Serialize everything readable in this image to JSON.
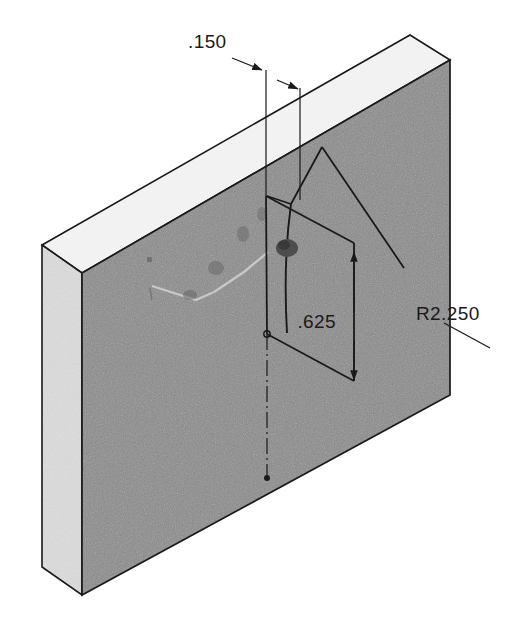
{
  "drawing": {
    "title": "Isometric plate with radiused slot detail",
    "view_type": "isometric",
    "background_color": "#ffffff"
  },
  "solid": {
    "name": "rectangular-plate",
    "faces": {
      "front": {
        "label": "front-face",
        "color": "#8a8a8a"
      },
      "top": {
        "label": "top-face",
        "color": "#f4f4f4"
      },
      "left": {
        "label": "left-side-face",
        "color": "#dcdcdc"
      }
    },
    "edge_color": "#1a1a1a"
  },
  "dimensions": [
    {
      "id": "width-dim",
      "value": ".150",
      "name": "dimension-150",
      "orientation": "leader-with-arrows",
      "text_x": 188,
      "text_y": 48
    },
    {
      "id": "height-dim",
      "value": ".625",
      "name": "dimension-625",
      "orientation": "vertical",
      "text_x": 336,
      "text_y": 328
    },
    {
      "id": "radius-dim",
      "value": "R2.250",
      "name": "dimension-r2250",
      "orientation": "leader",
      "text_x": 416,
      "text_y": 320
    }
  ],
  "features": {
    "pocket": {
      "name": "dark-pocket-mark"
    },
    "centerline": {
      "name": "vertical-centerline",
      "style": "dash-dot"
    },
    "arc": {
      "name": "radius-arc-edge"
    },
    "faint_marks": {
      "name": "faint-surface-marks"
    }
  },
  "colors": {
    "front_face": "#8a8a8a",
    "top_face": "#f4f4f4",
    "left_face": "#dcdcdc",
    "line": "#1a1a1a",
    "text": "#1a1a1a"
  }
}
